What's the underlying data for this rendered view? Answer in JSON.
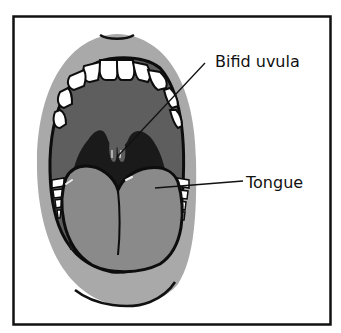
{
  "diagram": {
    "labels": {
      "uvula": "Bifid uvula",
      "tongue": "Tongue"
    },
    "colors": {
      "frame": "#111111",
      "lips": "#a9a9a9",
      "palate": "#5e5e5e",
      "throat": "#1a1a1a",
      "tongue": "#8a8a8a",
      "teeth": "#ffffff",
      "outline": "#0d0d0d"
    }
  }
}
